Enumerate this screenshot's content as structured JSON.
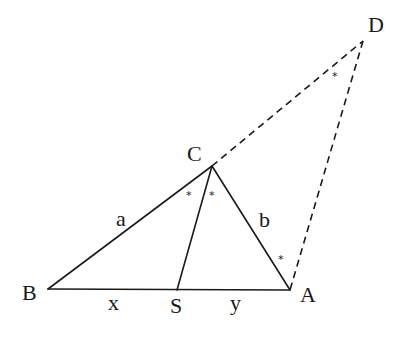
{
  "diagram": {
    "type": "geometry-triangle-angle-bisector",
    "points": {
      "A": {
        "label": "A",
        "x": 290,
        "y": 290
      },
      "B": {
        "label": "B",
        "x": 48,
        "y": 289
      },
      "C": {
        "label": "C",
        "x": 212,
        "y": 166
      },
      "D": {
        "label": "D",
        "x": 363,
        "y": 41
      },
      "S": {
        "label": "S",
        "x": 177,
        "y": 290
      }
    },
    "segments": {
      "solid": [
        [
          "B",
          "C"
        ],
        [
          "C",
          "A"
        ],
        [
          "B",
          "A"
        ],
        [
          "C",
          "S"
        ]
      ],
      "dashed": [
        [
          "C",
          "D"
        ],
        [
          "D",
          "A"
        ]
      ]
    },
    "side_labels": {
      "a": "a",
      "b": "b",
      "x": "x",
      "y": "y"
    },
    "angle_marker": "*",
    "angle_marks": [
      {
        "near": "C-left",
        "x": 191,
        "y": 194
      },
      {
        "near": "C-right",
        "x": 214,
        "y": 194
      },
      {
        "near": "D",
        "x": 337,
        "y": 75
      },
      {
        "near": "A",
        "x": 283,
        "y": 258
      }
    ]
  }
}
